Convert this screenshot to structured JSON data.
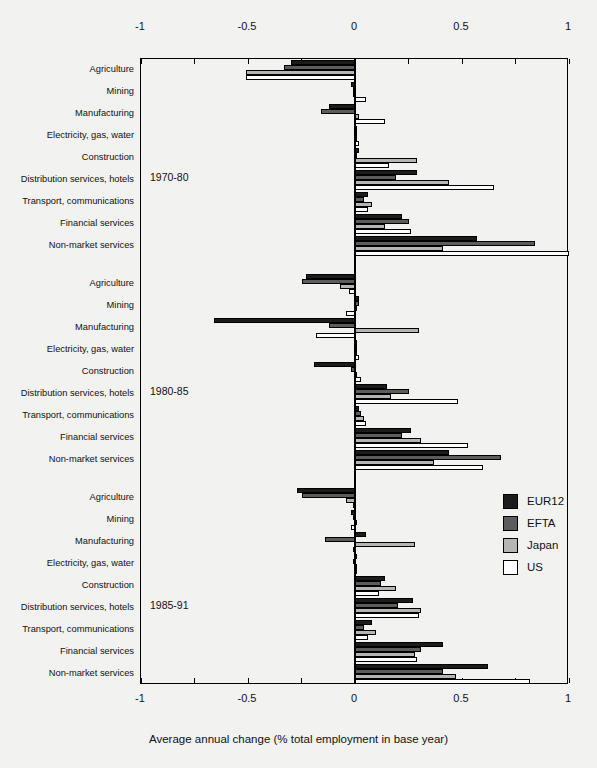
{
  "chart_data": {
    "type": "bar",
    "orientation": "horizontal",
    "title": "",
    "xlabel": "Average annual change (% total employment in base year)",
    "ylabel": "",
    "xlim": [
      -1,
      1
    ],
    "xticks": [
      -1,
      -0.75,
      -0.5,
      -0.25,
      0,
      0.25,
      0.5,
      0.75,
      1
    ],
    "xtick_labels": [
      "-1",
      "",
      "-0.5",
      "",
      "0",
      "",
      "0.5",
      "",
      "1"
    ],
    "grid": false,
    "legend_position": "right-middle",
    "legend": [
      "EUR12",
      "EFTA",
      "Japan",
      "US"
    ],
    "series_colors": {
      "EUR12": "#1c1c1c",
      "EFTA": "#5c5c5c",
      "Japan": "#b5b5b5",
      "US": "#ffffff"
    },
    "categories": [
      "Agriculture",
      "Mining",
      "Manufacturing",
      "Electricity, gas, water",
      "Construction",
      "Distribution services, hotels",
      "Transport, communications",
      "Financial services",
      "Non-market services"
    ],
    "panels": [
      {
        "period": "1970-80",
        "series": [
          {
            "name": "EUR12",
            "values": [
              -0.3,
              -0.02,
              -0.12,
              0.01,
              0.02,
              0.29,
              0.06,
              0.22,
              0.57
            ]
          },
          {
            "name": "EFTA",
            "values": [
              -0.33,
              -0.01,
              -0.16,
              0.01,
              0.01,
              0.19,
              0.04,
              0.25,
              0.84
            ]
          },
          {
            "name": "Japan",
            "values": [
              -0.51,
              -0.01,
              0.02,
              0.01,
              0.29,
              0.44,
              0.08,
              0.14,
              0.41
            ]
          },
          {
            "name": "US",
            "values": [
              -0.51,
              0.05,
              0.14,
              0.02,
              0.16,
              0.65,
              0.06,
              0.26,
              1.0
            ]
          }
        ]
      },
      {
        "period": "1980-85",
        "series": [
          {
            "name": "EUR12",
            "values": [
              -0.23,
              0.02,
              -0.66,
              0.01,
              -0.19,
              0.15,
              0.02,
              0.26,
              0.44
            ]
          },
          {
            "name": "EFTA",
            "values": [
              -0.25,
              0.02,
              -0.12,
              0.01,
              -0.02,
              0.25,
              0.03,
              0.22,
              0.68
            ]
          },
          {
            "name": "Japan",
            "values": [
              -0.07,
              0.0,
              0.3,
              0.01,
              0.01,
              0.17,
              0.04,
              0.31,
              0.37
            ]
          },
          {
            "name": "US",
            "values": [
              -0.03,
              -0.04,
              -0.18,
              0.02,
              0.03,
              0.48,
              0.05,
              0.53,
              0.6
            ]
          }
        ]
      },
      {
        "period": "1985-91",
        "series": [
          {
            "name": "EUR12",
            "values": [
              -0.27,
              -0.02,
              0.05,
              0.0,
              0.14,
              0.27,
              0.08,
              0.41,
              0.62
            ]
          },
          {
            "name": "EFTA",
            "values": [
              -0.25,
              -0.01,
              -0.14,
              -0.01,
              0.12,
              0.2,
              0.04,
              0.31,
              0.41
            ]
          },
          {
            "name": "Japan",
            "values": [
              -0.04,
              0.0,
              0.28,
              0.0,
              0.19,
              0.31,
              0.1,
              0.28,
              0.47
            ]
          },
          {
            "name": "US",
            "values": [
              -0.01,
              -0.02,
              -0.01,
              0.0,
              0.11,
              0.3,
              0.06,
              0.29,
              0.82
            ]
          }
        ]
      }
    ]
  }
}
